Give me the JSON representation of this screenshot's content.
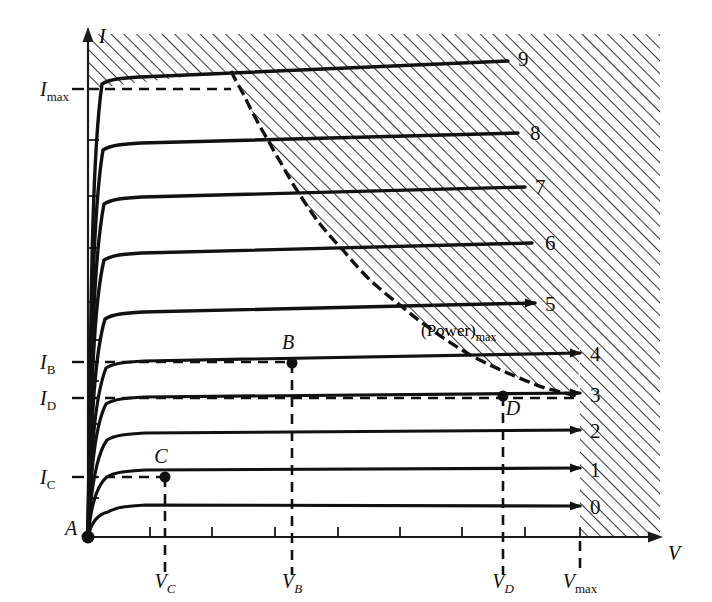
{
  "figure": {
    "kind": "transistor-output-characteristics",
    "axis_x_label": "V",
    "axis_y_label": "I",
    "origin_label": "A",
    "power_label_main": "(Power)",
    "power_label_sub": "max"
  },
  "axes": {
    "y_tick_labels": [
      {
        "id": "imax",
        "base": "I",
        "sub": "max",
        "y_px": 89
      },
      {
        "id": "ib",
        "base": "I",
        "sub": "B",
        "y_px": 362
      },
      {
        "id": "id",
        "base": "I",
        "sub": "D",
        "y_px": 398
      },
      {
        "id": "ic",
        "base": "I",
        "sub": "C",
        "y_px": 477
      }
    ],
    "x_tick_labels": [
      {
        "id": "vc",
        "base": "V",
        "sub": "C",
        "x_px": 165
      },
      {
        "id": "vb",
        "base": "V",
        "sub": "B",
        "x_px": 292
      },
      {
        "id": "vd",
        "base": "V",
        "sub": "D",
        "x_px": 503
      },
      {
        "id": "vmax",
        "base": "V",
        "sub": "max",
        "x_px": 580
      }
    ]
  },
  "chart_data": {
    "type": "line",
    "title": "",
    "xlabel": "V",
    "ylabel": "I",
    "xlim": [
      0,
      660
    ],
    "ylim": [
      0,
      1
    ],
    "grid": false,
    "legend_position": "right-of-curve-ends",
    "series": [
      {
        "name": "0",
        "label_x": 590,
        "label_y": 508,
        "plateau_y": 508,
        "knee_x": 104,
        "end_x": 580,
        "end_y": 506,
        "arrow": true
      },
      {
        "name": "1",
        "label_x": 590,
        "label_y": 471,
        "plateau_y": 473,
        "knee_x": 103,
        "end_x": 580,
        "end_y": 468,
        "arrow": true
      },
      {
        "name": "2",
        "label_x": 590,
        "label_y": 432,
        "plateau_y": 436,
        "knee_x": 103,
        "end_x": 580,
        "end_y": 430,
        "arrow": true
      },
      {
        "name": "3",
        "label_x": 590,
        "label_y": 396,
        "plateau_y": 400,
        "knee_x": 102,
        "end_x": 580,
        "end_y": 393,
        "arrow": true
      },
      {
        "name": "4",
        "label_x": 590,
        "label_y": 355,
        "plateau_y": 364,
        "knee_x": 102,
        "end_x": 580,
        "end_y": 353,
        "arrow": true
      },
      {
        "name": "5",
        "label_x": 545,
        "label_y": 305,
        "plateau_y": 315,
        "knee_x": 101,
        "end_x": 535,
        "end_y": 303,
        "arrow": true
      },
      {
        "name": "6",
        "label_x": 545,
        "label_y": 244,
        "plateau_y": 256,
        "knee_x": 100,
        "end_x": 532,
        "end_y": 243,
        "arrow": false
      },
      {
        "name": "7",
        "label_x": 535,
        "label_y": 188,
        "plateau_y": 200,
        "knee_x": 100,
        "end_x": 525,
        "end_y": 187,
        "arrow": false
      },
      {
        "name": "8",
        "label_x": 530,
        "label_y": 134,
        "plateau_y": 146,
        "knee_x": 99,
        "end_x": 518,
        "end_y": 133,
        "arrow": false
      },
      {
        "name": "9",
        "label_x": 518,
        "label_y": 60,
        "plateau_y": 80,
        "knee_x": 98,
        "end_x": 508,
        "end_y": 61,
        "arrow": false
      }
    ],
    "power_hyperbola": [
      [
        231,
        71
      ],
      [
        244,
        95
      ],
      [
        255,
        117
      ],
      [
        268,
        140
      ],
      [
        281,
        163
      ],
      [
        300,
        195
      ],
      [
        320,
        224
      ],
      [
        343,
        250
      ],
      [
        370,
        280
      ],
      [
        400,
        305
      ],
      [
        432,
        330
      ],
      [
        472,
        356
      ],
      [
        510,
        374
      ],
      [
        545,
        388
      ],
      [
        578,
        396
      ]
    ],
    "operating_points": [
      {
        "name": "A",
        "x_px": 88,
        "y_px": 537,
        "label_dx": -17,
        "label_dy": -2
      },
      {
        "name": "B",
        "x_px": 292,
        "y_px": 363,
        "label_dx": -4,
        "label_dy": -14
      },
      {
        "name": "C",
        "x_px": 165,
        "y_px": 477,
        "label_dx": -4,
        "label_dy": -14
      },
      {
        "name": "D",
        "x_px": 503,
        "y_px": 396,
        "label_dx": 10,
        "label_dy": 19
      }
    ],
    "forbidden_regions": [
      {
        "name": "above-I-max",
        "description": "hatched band above I_max line"
      },
      {
        "name": "beyond-power-max",
        "description": "hatched region right of maximum power hyperbola"
      },
      {
        "name": "beyond-V-max",
        "description": "hatched region right of V_max"
      }
    ]
  },
  "geometry": {
    "axis_x_px": 88,
    "axis_y_px": 537,
    "imax_y_px": 89,
    "vmax_x_px": 580,
    "x_ticks_px": [
      150,
      212,
      275,
      338,
      400,
      462,
      525,
      580
    ],
    "y_ticks_px": [
      89,
      140,
      196,
      248,
      302,
      340,
      362,
      381,
      398,
      424,
      477,
      498
    ]
  }
}
